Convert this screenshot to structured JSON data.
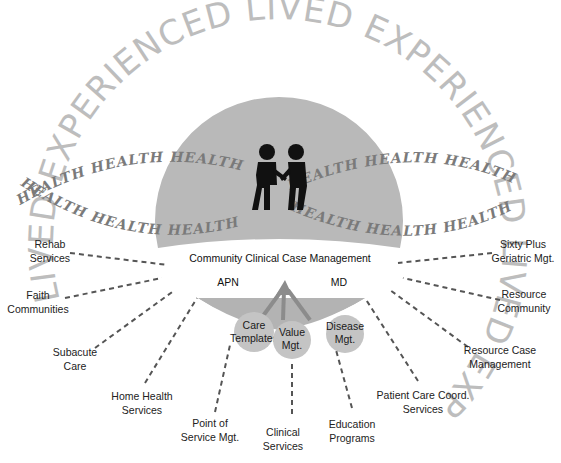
{
  "diagram": {
    "center_title": "Community Clinical Case Management",
    "roles": {
      "left": "APN",
      "right": "MD"
    },
    "arc_text": {
      "outer": "LIVED EXPERIENCED LIVED EXPERIENCED LIVED EXPERIENCED",
      "health": "HEALTH"
    },
    "core_circles": [
      {
        "line1": "Care",
        "line2": "Templates"
      },
      {
        "line1": "Value",
        "line2": "Mgt."
      },
      {
        "line1": "Disease",
        "line2": "Mgt."
      }
    ],
    "left_labels": [
      {
        "line1": "Rehab",
        "line2": "Services"
      },
      {
        "line1": "Faith",
        "line2": "Communities"
      },
      {
        "line1": "Subacute",
        "line2": "Care"
      },
      {
        "line1": "Home Health",
        "line2": "Services"
      },
      {
        "line1": "Point of",
        "line2": "Service Mgt."
      }
    ],
    "bottom_labels": [
      {
        "line1": "Clinical",
        "line2": "Services"
      },
      {
        "line1": "Education",
        "line2": "Programs"
      }
    ],
    "right_labels": [
      {
        "line1": "Patient Care Coord.",
        "line2": "Services"
      },
      {
        "line1": "Resource Case",
        "line2": "Management"
      },
      {
        "line1": "Resource",
        "line2": "Community"
      },
      {
        "line1": "Sixty Plus",
        "line2": "Geriatric Mgt."
      }
    ],
    "icons": {
      "center": "handshake-people-icon"
    },
    "colors": {
      "dome": "#b9b9b9",
      "circle": "#c4c4c4",
      "fan": "#a9a9a9",
      "arc_text": "#bdbdbd",
      "health_text": "#7a7a7a"
    }
  }
}
